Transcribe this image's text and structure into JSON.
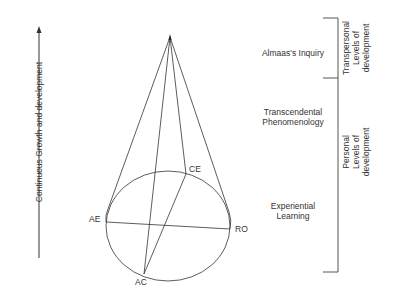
{
  "axis": {
    "label": "Continuous Growth and development"
  },
  "cone": {
    "points": {
      "ae": "AE",
      "ro": "RO",
      "ce": "CE",
      "ac": "AC"
    }
  },
  "stages": [
    {
      "label": "Almaas's Inquiry"
    },
    {
      "label_line1": "Transcendental",
      "label_line2": "Phenomenology"
    },
    {
      "label_line1": "Experiential",
      "label_line2": "Learning"
    }
  ],
  "brackets": {
    "transpersonal": {
      "line1": "Transpersonal",
      "line2": "Levels of",
      "line3": "development"
    },
    "personal": {
      "line1": "Personal",
      "line2": "Levels of",
      "line3": "development"
    }
  },
  "colors": {
    "line": "#333333",
    "text": "#333333",
    "background": "#ffffff"
  }
}
